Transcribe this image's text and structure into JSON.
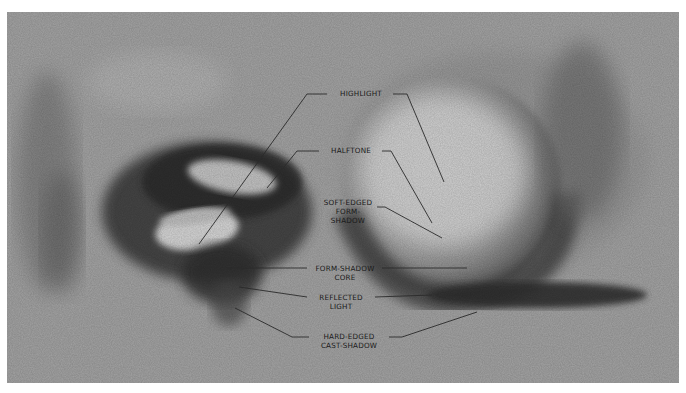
{
  "figure": {
    "background_color": "#a3a3a3",
    "subjects": [
      "eye",
      "sphere"
    ]
  },
  "labels": [
    {
      "id": "highlight",
      "lines": [
        "HIGHLIGHT"
      ]
    },
    {
      "id": "halftone",
      "lines": [
        "HALFTONE"
      ]
    },
    {
      "id": "soft-edged-form-shadow",
      "lines": [
        "SOFT-EDGED",
        "FORM-",
        "SHADOW"
      ]
    },
    {
      "id": "form-shadow-core",
      "lines": [
        "FORM-SHADOW",
        "CORE"
      ]
    },
    {
      "id": "reflected-light",
      "lines": [
        "REFLECTED",
        "LIGHT"
      ]
    },
    {
      "id": "hard-edged-cast-shadow",
      "lines": [
        "HARD-EDGED",
        "CAST-SHADOW"
      ]
    }
  ]
}
